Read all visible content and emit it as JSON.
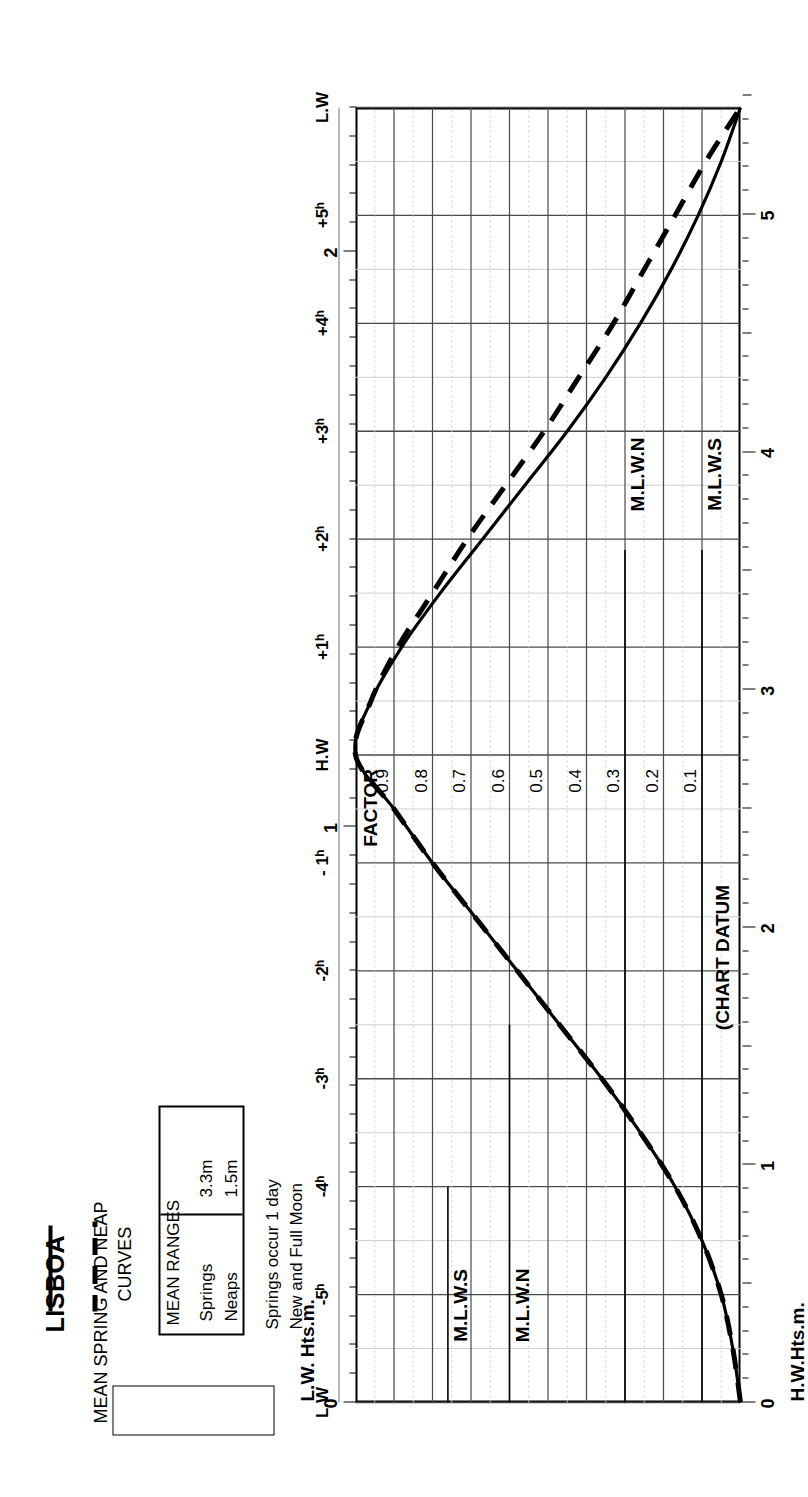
{
  "title": "LISBOA",
  "subtitle": {
    "line1": "MEAN SPRING AND NEAP",
    "line2": "CURVES"
  },
  "legend": {
    "header": "MEAN RANGES",
    "rows": [
      {
        "name": "Springs",
        "range": "3.3m",
        "style": "solid"
      },
      {
        "name": "Neaps",
        "range": "1.5m",
        "style": "dashed"
      }
    ]
  },
  "note": {
    "line1": "Springs occur 1 day",
    "line2": "after",
    "line3": "New and Full Moon"
  },
  "axes": {
    "left_title": "H.W.Hts.m.",
    "right_title": "L.W. Hts.m.",
    "left_ticks": [
      "0",
      "1",
      "2",
      "3",
      "4",
      "5"
    ],
    "right_ticks": [
      "0",
      "1",
      "2"
    ],
    "factor_title": "FACTOR",
    "factor_ticks": [
      "0.9",
      "0.8",
      "0.7",
      "0.6",
      "0.5",
      "0.4",
      "0.3",
      "0.2",
      "0.1"
    ],
    "time_ticks": [
      "L.W",
      "-5ʰ",
      "-4ʰ",
      "-3ʰ",
      "-2ʰ",
      "- 1ʰ",
      "H.W",
      "+1ʰ",
      "+2ʰ",
      "+3ʰ",
      "+4ʰ",
      "+5ʰ",
      "L.W"
    ]
  },
  "markers": {
    "datum": "(CHART DATUM",
    "left_mlws": "M.L.W.S",
    "left_mlwn": "M.L.W.N",
    "right_mlwn": "M.L.W.N",
    "right_mlws": "M.L.W.S"
  },
  "chart_data": {
    "type": "line",
    "xlabel": "Hours from High Water",
    "ylabel": "Tidal Factor",
    "xlim": [
      -6,
      6
    ],
    "ylim": [
      0,
      1
    ],
    "grid": true,
    "legend_position": "top-left",
    "x": [
      -6,
      -5.5,
      -5,
      -4.5,
      -4,
      -3.5,
      -3,
      -2.5,
      -2,
      -1.5,
      -1,
      -0.5,
      0,
      0.5,
      1,
      1.5,
      2,
      2.5,
      3,
      3.5,
      4,
      4.5,
      5,
      5.5,
      6
    ],
    "series": [
      {
        "name": "Springs",
        "range_m": 3.3,
        "style": "solid",
        "values": [
          0.0,
          0.02,
          0.05,
          0.1,
          0.17,
          0.26,
          0.36,
          0.47,
          0.58,
          0.69,
          0.8,
          0.9,
          1.0,
          0.96,
          0.88,
          0.78,
          0.67,
          0.56,
          0.45,
          0.35,
          0.26,
          0.18,
          0.11,
          0.05,
          0.0
        ]
      },
      {
        "name": "Neaps",
        "range_m": 1.5,
        "style": "dashed",
        "values": [
          0.0,
          0.02,
          0.05,
          0.1,
          0.17,
          0.26,
          0.36,
          0.47,
          0.58,
          0.69,
          0.8,
          0.9,
          1.0,
          0.96,
          0.89,
          0.8,
          0.71,
          0.61,
          0.51,
          0.42,
          0.33,
          0.25,
          0.17,
          0.09,
          0.0
        ]
      }
    ],
    "reference_levels": {
      "hw_scale_m": [
        0,
        1,
        2,
        3,
        4,
        5
      ],
      "lw_scale_m": [
        0,
        1,
        2
      ],
      "M.L.W.S_hw": 3.8,
      "M.L.W.N_hw": 3.0,
      "M.L.W.N_lw": 1.5,
      "M.L.W.S_lw": 0.5
    }
  }
}
